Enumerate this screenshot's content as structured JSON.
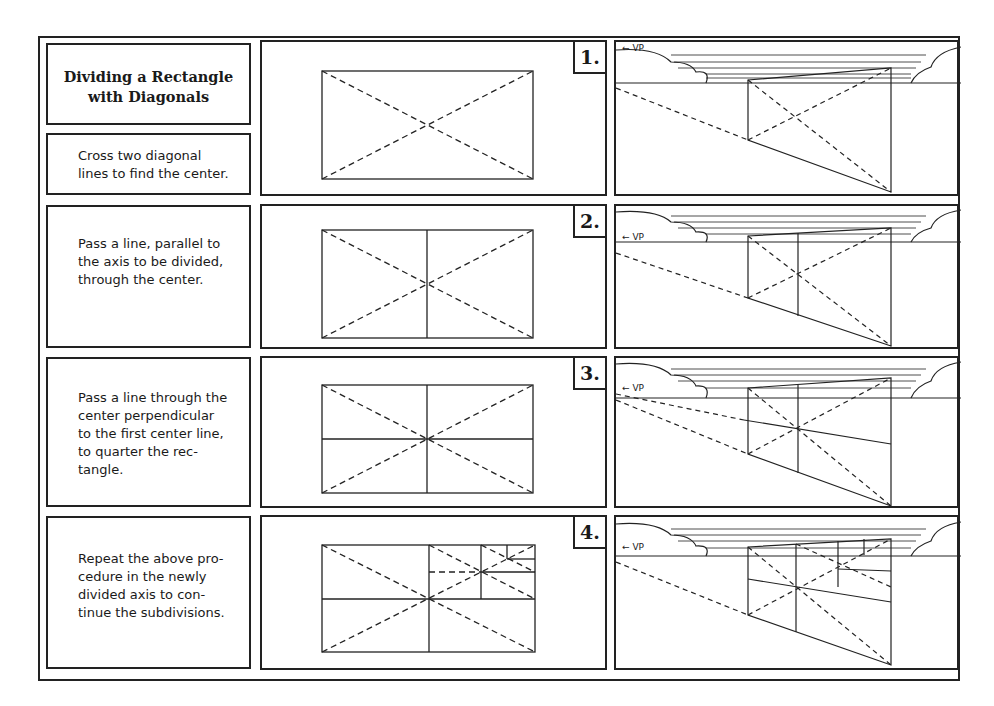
{
  "title": "Dividing a Rectangle with Diagonals",
  "title_lines": [
    "Dividing a Rectangle",
    "with Diagonals"
  ],
  "steps": [
    {
      "number": "1.",
      "text_lines": [
        "Cross two diagonal",
        "lines to find the center."
      ]
    },
    {
      "number": "2.",
      "text_lines": [
        "Pass a line, parallel to",
        "the axis to be divided,",
        "through the center."
      ]
    },
    {
      "number": "3.",
      "text_lines": [
        "Pass a line through the",
        "center perpendicular",
        "to the first center line,",
        "to quarter the rec-",
        "tangle."
      ]
    },
    {
      "number": "4.",
      "text_lines": [
        "Repeat the above pro-",
        "cedure in the newly",
        "divided axis to con-",
        "tinue the subdivisions."
      ]
    }
  ],
  "vp_label": "← VP",
  "colors": {
    "ink": "#222222",
    "paper": "#ffffff"
  }
}
